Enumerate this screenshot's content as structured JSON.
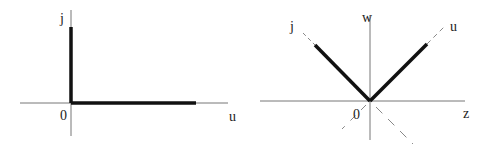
{
  "colors": {
    "axis": "#777777",
    "thick": "#111111",
    "dashed": "#888888",
    "background": "#ffffff"
  },
  "left_diagram": {
    "labels": {
      "vertical_axis": "j",
      "horizontal_axis": "u",
      "origin": "0"
    },
    "origin": [
      71,
      103
    ],
    "axes": {
      "horizontal": {
        "x1": 20,
        "x2": 228,
        "y": 103
      },
      "vertical": {
        "x": 71,
        "y1": 10,
        "y2": 136
      }
    },
    "thick_segments": [
      {
        "x1": 71,
        "y1": 27,
        "x2": 71,
        "y2": 103
      },
      {
        "x1": 71,
        "y1": 103,
        "x2": 196,
        "y2": 103
      }
    ]
  },
  "right_diagram": {
    "labels": {
      "vertical_axis": "w",
      "horizontal_axis": "z",
      "left_diagonal": "j",
      "right_diagonal": "u",
      "origin": "0"
    },
    "origin": [
      370,
      101
    ],
    "axes": {
      "horizontal": {
        "x1": 260,
        "x2": 465,
        "y": 101
      },
      "vertical": {
        "x": 370,
        "y1": 15,
        "y2": 140
      }
    },
    "thick_segments": [
      {
        "x1": 315,
        "y1": 45,
        "x2": 370,
        "y2": 101
      },
      {
        "x1": 370,
        "y1": 101,
        "x2": 427,
        "y2": 44
      }
    ],
    "dashed_segments": [
      {
        "x1": 303,
        "y1": 33,
        "x2": 315,
        "y2": 45
      },
      {
        "x1": 427,
        "y1": 44,
        "x2": 446,
        "y2": 25
      },
      {
        "x1": 370,
        "y1": 101,
        "x2": 342,
        "y2": 129
      },
      {
        "x1": 370,
        "y1": 101,
        "x2": 413,
        "y2": 144
      }
    ]
  }
}
